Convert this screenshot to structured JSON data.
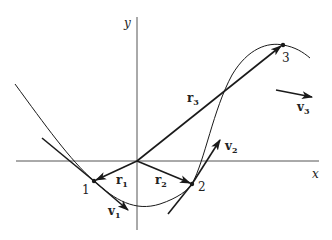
{
  "figure": {
    "type": "diagram",
    "colors": {
      "ink": "#1a1a1a",
      "background": "#ffffff"
    },
    "axes": {
      "x_label": "x",
      "y_label": "y"
    },
    "points": [
      {
        "id": "1",
        "label": "1"
      },
      {
        "id": "2",
        "label": "2"
      },
      {
        "id": "3",
        "label": "3"
      }
    ],
    "position_vectors": [
      {
        "name": "r",
        "sub": "1"
      },
      {
        "name": "r",
        "sub": "2"
      },
      {
        "name": "r",
        "sub": "3"
      }
    ],
    "velocity_vectors": [
      {
        "name": "v",
        "sub": "1"
      },
      {
        "name": "v",
        "sub": "2"
      },
      {
        "name": "v",
        "sub": "3"
      }
    ]
  }
}
